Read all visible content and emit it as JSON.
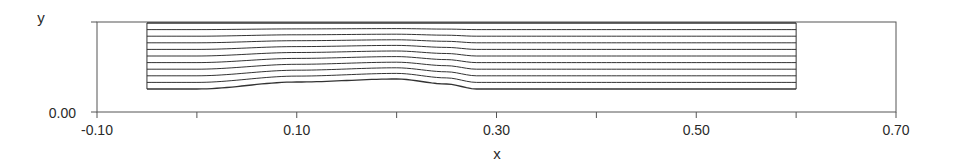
{
  "chart_data": {
    "type": "line",
    "title": "",
    "xlabel": "x",
    "ylabel": "y",
    "xlim": [
      -0.1,
      0.7
    ],
    "ylim": [
      0.0,
      0.09
    ],
    "x_ticks_labeled": [
      "-0.10",
      "0.10",
      "0.30",
      "0.50",
      "0.70"
    ],
    "x_ticks_all": [
      -0.1,
      0.0,
      0.1,
      0.2,
      0.3,
      0.4,
      0.5,
      0.6,
      0.7
    ],
    "y_ticks_labeled": [
      "0.00"
    ],
    "grid": false,
    "legend": null,
    "mesh": {
      "x_start": -0.05,
      "x_end": 0.6,
      "top_y": 0.089,
      "bottom_y_inlet": 0.023,
      "line_count": 11,
      "bottom_wall_profile": {
        "x": [
          -0.05,
          0.0,
          0.1,
          0.2,
          0.25,
          0.28,
          0.6
        ],
        "y": [
          0.023,
          0.023,
          0.03,
          0.033,
          0.028,
          0.023,
          0.023
        ]
      }
    }
  },
  "axes": {
    "x_label": "x",
    "y_label": "y",
    "y_zero_label": "0.00",
    "x_tick_labels": [
      {
        "value": -0.1,
        "label": "-0.10"
      },
      {
        "value": 0.1,
        "label": "0.10"
      },
      {
        "value": 0.3,
        "label": "0.30"
      },
      {
        "value": 0.5,
        "label": "0.50"
      },
      {
        "value": 0.7,
        "label": "0.70"
      }
    ]
  },
  "colors": {
    "line": "#333333",
    "axis": "#555555",
    "text": "#2a2a2a",
    "background": "#ffffff"
  }
}
